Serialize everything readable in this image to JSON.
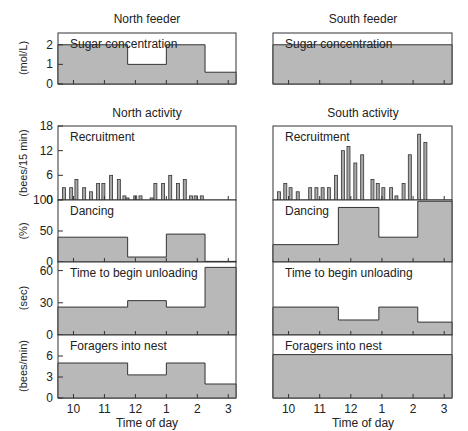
{
  "chart_data": [
    {
      "type": "area",
      "panel": "north-feeder-sugar",
      "title": "North feeder",
      "label": "Sugar concentration",
      "ylabel": "(mol/L)",
      "ylim": [
        0,
        2.6
      ],
      "yticks": [
        0,
        1,
        2
      ],
      "steps": [
        {
          "from": 9.5,
          "to": 11.75,
          "value": 2
        },
        {
          "from": 11.75,
          "to": 13.0,
          "value": 1
        },
        {
          "from": 13.0,
          "to": 14.25,
          "value": 2
        },
        {
          "from": 14.25,
          "to": 15.25,
          "value": 0.6
        }
      ]
    },
    {
      "type": "area",
      "panel": "south-feeder-sugar",
      "title": "South feeder",
      "label": "Sugar concentration",
      "ylim": [
        0,
        2.6
      ],
      "steps": [
        {
          "from": 9.5,
          "to": 15.25,
          "value": 2
        }
      ]
    },
    {
      "type": "bar",
      "panel": "north-recruitment",
      "title": "North activity",
      "label": "Recruitment",
      "ylabel": "(bees/15 min)",
      "ylim": [
        0,
        18
      ],
      "yticks": [
        0,
        6,
        12,
        18
      ],
      "x": [
        9.55,
        9.78,
        9.95,
        10.2,
        10.42,
        10.65,
        10.82,
        11.07,
        11.32,
        11.5,
        11.6,
        11.85,
        12.02,
        12.38,
        12.5,
        12.75,
        12.98,
        13.23,
        13.45,
        13.65,
        13.8,
        14.0
      ],
      "values": [
        3,
        3,
        5,
        3,
        2,
        4,
        4,
        6,
        5,
        1,
        0.5,
        1,
        1,
        0.5,
        4,
        4,
        6,
        4,
        5,
        1,
        1,
        1
      ]
    },
    {
      "type": "bar",
      "panel": "south-recruitment",
      "title": "South activity",
      "label": "Recruitment",
      "ylim": [
        0,
        18
      ],
      "x": [
        9.55,
        9.75,
        9.92,
        10.15,
        10.55,
        10.75,
        10.95,
        11.15,
        11.38,
        11.6,
        11.78,
        12.0,
        12.22,
        12.55,
        12.72,
        12.9,
        13.15,
        13.32,
        13.55,
        13.75,
        14.05,
        14.25
      ],
      "values": [
        2,
        4,
        3,
        2,
        3,
        3,
        3,
        3,
        6,
        12,
        13,
        9,
        11,
        5,
        4,
        3,
        3,
        1,
        4,
        11,
        16,
        14
      ]
    },
    {
      "type": "area",
      "panel": "north-dancing",
      "label": "Dancing",
      "ylabel": "(%)",
      "ylim": [
        0,
        100
      ],
      "yticks": [
        0,
        50,
        100
      ],
      "steps": [
        {
          "from": 9.5,
          "to": 11.75,
          "value": 40
        },
        {
          "from": 11.75,
          "to": 13.0,
          "value": 8
        },
        {
          "from": 13.0,
          "to": 14.25,
          "value": 45
        },
        {
          "from": 14.25,
          "to": 15.25,
          "value": 1
        }
      ]
    },
    {
      "type": "area",
      "panel": "south-dancing",
      "label": "Dancing",
      "ylim": [
        0,
        100
      ],
      "steps": [
        {
          "from": 9.5,
          "to": 11.6,
          "value": 28
        },
        {
          "from": 11.6,
          "to": 12.9,
          "value": 88
        },
        {
          "from": 12.9,
          "to": 14.15,
          "value": 40
        },
        {
          "from": 14.15,
          "to": 15.25,
          "value": 98
        }
      ]
    },
    {
      "type": "area",
      "panel": "north-unloading",
      "label": "Time to begin unloading",
      "ylabel": "(sec)",
      "ylim": [
        0,
        68
      ],
      "yticks": [
        0,
        30,
        60
      ],
      "steps": [
        {
          "from": 9.5,
          "to": 11.75,
          "value": 26
        },
        {
          "from": 11.75,
          "to": 13.0,
          "value": 32
        },
        {
          "from": 13.0,
          "to": 14.25,
          "value": 26
        },
        {
          "from": 14.25,
          "to": 15.25,
          "value": 63
        }
      ]
    },
    {
      "type": "area",
      "panel": "south-unloading",
      "label": "Time to begin unloading",
      "ylim": [
        0,
        68
      ],
      "steps": [
        {
          "from": 9.5,
          "to": 11.6,
          "value": 26
        },
        {
          "from": 11.6,
          "to": 12.9,
          "value": 14
        },
        {
          "from": 12.9,
          "to": 14.15,
          "value": 26
        },
        {
          "from": 14.15,
          "to": 15.25,
          "value": 12
        }
      ]
    },
    {
      "type": "area",
      "panel": "north-foragers",
      "label": "Foragers into nest",
      "ylabel": "(bees/min)",
      "ylim": [
        0,
        9
      ],
      "yticks": [
        0,
        3,
        6
      ],
      "xlabel": "Time of day",
      "xticks": [
        "10",
        "11",
        "12",
        "1",
        "2",
        "3"
      ],
      "steps": [
        {
          "from": 9.5,
          "to": 11.75,
          "value": 5
        },
        {
          "from": 11.75,
          "to": 13.0,
          "value": 3.3
        },
        {
          "from": 13.0,
          "to": 14.25,
          "value": 5
        },
        {
          "from": 14.25,
          "to": 15.25,
          "value": 2
        }
      ]
    },
    {
      "type": "area",
      "panel": "south-foragers",
      "label": "Foragers into nest",
      "ylim": [
        0,
        9
      ],
      "xlabel": "Time of day",
      "xticks": [
        "10",
        "11",
        "12",
        "1",
        "2",
        "3"
      ],
      "steps": [
        {
          "from": 9.5,
          "to": 15.25,
          "value": 6.2
        }
      ]
    }
  ],
  "titles": {
    "north_feeder": "North feeder",
    "south_feeder": "South feeder",
    "north_activity": "North activity",
    "south_activity": "South activity"
  },
  "labels": {
    "sugar": "Sugar concentration",
    "recruitment": "Recruitment",
    "dancing": "Dancing",
    "unloading": "Time to begin unloading",
    "foragers": "Foragers into nest",
    "xlabel": "Time of day"
  },
  "ylabels": {
    "sugar": "(mol/L)",
    "recruitment": "(bees/15 min)",
    "dancing": "(%)",
    "unloading": "(sec)",
    "foragers": "(bees/min)"
  },
  "colors": {
    "fill": "#b8b8b8",
    "line": "#333333",
    "bar": "#a8a8a8"
  }
}
